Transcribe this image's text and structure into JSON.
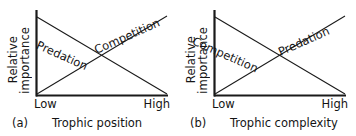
{
  "figure": {
    "background_color": "#ffffff",
    "line_color": "#1a1a1a",
    "text_color": "#141414"
  },
  "chart_data": {
    "type": "line",
    "title": "",
    "panels": [
      {
        "letter": "(a)",
        "xlabel": "Trophic position",
        "ylabel_line1": "Relative",
        "ylabel_line2": "importance",
        "xticks": [
          "Low",
          "High"
        ],
        "yticks": [],
        "grid": false,
        "legend": "inline-labels",
        "xlim": [
          0,
          1
        ],
        "ylim": [
          0,
          1
        ],
        "series": [
          {
            "name": "Predation",
            "x": [
              0,
              1
            ],
            "values": [
              1,
              0
            ],
            "trend": "decreasing",
            "label": "Predation",
            "label_x": 40,
            "label_y": 38,
            "label_rotation": -24
          },
          {
            "name": "Competition",
            "x": [
              0,
              1
            ],
            "values": [
              0,
              1
            ],
            "trend": "increasing",
            "label": "Competition",
            "label_x": 92,
            "label_y": 44,
            "label_rotation": -24
          }
        ],
        "crossing_point": {
          "x": 0.5,
          "y": 0.5
        }
      },
      {
        "letter": "(b)",
        "xlabel": "Trophic complexity",
        "ylabel_line1": "Relative",
        "ylabel_line2": "importance",
        "xticks": [
          "Low",
          "High"
        ],
        "yticks": [],
        "grid": false,
        "legend": "inline-labels",
        "xlim": [
          0,
          1
        ],
        "ylim": [
          0,
          1
        ],
        "series": [
          {
            "name": "Competition",
            "x": [
              0,
              1
            ],
            "values": [
              1,
              0
            ],
            "trend": "decreasing",
            "label": "Competition",
            "label_x": 18,
            "label_y": 34,
            "label_rotation": -24
          },
          {
            "name": "Predation",
            "x": [
              0,
              1
            ],
            "values": [
              0,
              1
            ],
            "trend": "increasing",
            "label": "Predation",
            "label_x": 98,
            "label_y": 46,
            "label_rotation": -24
          }
        ],
        "crossing_point": {
          "x": 0.5,
          "y": 0.5
        }
      }
    ],
    "xlabel": "",
    "ylabel": "Relative importance"
  }
}
